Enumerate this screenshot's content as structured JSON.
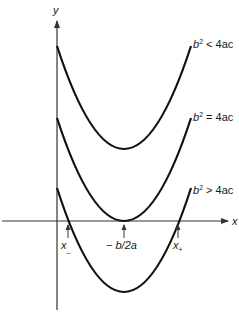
{
  "axes": {
    "x_label": "x",
    "y_label": "y"
  },
  "curves": [
    {
      "id": "top",
      "label_base": "b",
      "label_sup": "2",
      "label_rel": " < 4ac",
      "vertex": [
        124,
        149
      ],
      "start": [
        57,
        46
      ],
      "end": [
        191,
        46
      ]
    },
    {
      "id": "middle",
      "label_base": "b",
      "label_sup": "2",
      "label_rel": " = 4ac",
      "vertex": [
        124,
        221
      ],
      "start": [
        57,
        118
      ],
      "end": [
        191,
        118
      ]
    },
    {
      "id": "bottom",
      "label_base": "b",
      "label_sup": "2",
      "label_rel": " > 4ac",
      "vertex": [
        124,
        292
      ],
      "start": [
        57,
        188
      ],
      "end": [
        191,
        188
      ]
    }
  ],
  "markers": {
    "x_minus": "x",
    "x_minus_sub": "_",
    "vertex": "− b/2a",
    "x_plus": "x",
    "x_plus_sub": "+"
  },
  "colors": {
    "line": "#1a1a1a",
    "axis": "#333333",
    "background": "#ffffff"
  }
}
